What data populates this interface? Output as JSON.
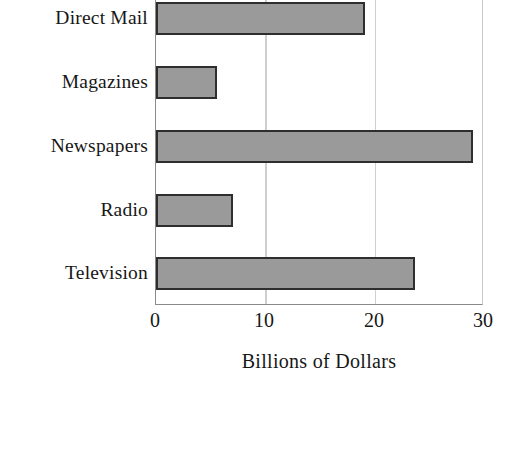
{
  "chart_data": {
    "type": "bar",
    "orientation": "horizontal",
    "title": "",
    "xlabel": "Billions of Dollars",
    "ylabel": "",
    "categories": [
      "Direct Mail",
      "Magazines",
      "Newspapers",
      "Radio",
      "Television"
    ],
    "values": [
      19.2,
      5.6,
      29.2,
      7.1,
      23.8
    ],
    "xlim": [
      0,
      30
    ],
    "xticks": [
      0,
      10,
      20,
      30
    ],
    "xtick_labels": [
      "0",
      "10",
      "20",
      "30"
    ],
    "grid": "vertical",
    "legend": "none",
    "bar_fill_color": "#9a9a9a",
    "bar_edge_color": "#2e2e2e",
    "axis_color": "#8a8a8a",
    "gridline_color": "#cfcfcf",
    "background_color": "#ffffff"
  },
  "axis": {
    "x_title": "Billions of Dollars"
  },
  "ticks": [
    {
      "label": "0",
      "value": 0
    },
    {
      "label": "10",
      "value": 10
    },
    {
      "label": "20",
      "value": 20
    },
    {
      "label": "30",
      "value": 30
    }
  ],
  "bars": [
    {
      "label": "Direct Mail",
      "value": 19.2
    },
    {
      "label": "Magazines",
      "value": 5.6
    },
    {
      "label": "Newspapers",
      "value": 29.2
    },
    {
      "label": "Radio",
      "value": 7.1
    },
    {
      "label": "Television",
      "value": 23.8
    }
  ]
}
